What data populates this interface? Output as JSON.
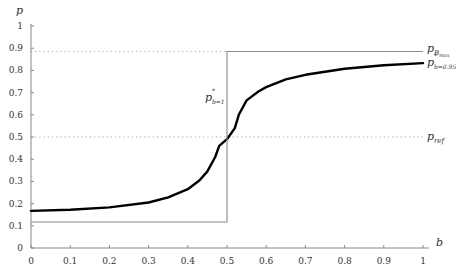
{
  "chart_data": {
    "type": "line",
    "title": "",
    "xlabel": "b",
    "ylabel": "p",
    "xlim": [
      0,
      1
    ],
    "ylim": [
      0,
      1
    ],
    "grid": false,
    "legend": "inline labels at right edge",
    "x_ticks": [
      "0",
      "0.1",
      "0.2",
      "0.3",
      "0.4",
      "0.5",
      "0.6",
      "0.7",
      "0.8",
      "0.9",
      "1"
    ],
    "y_ticks": [
      "0",
      "0.1",
      "0.2",
      "0.3",
      "0.4",
      "0.5",
      "0.6",
      "0.7",
      "0.8",
      "0.9",
      "1"
    ],
    "series": [
      {
        "name": "p*_{b=0.95}",
        "style": "thick solid black",
        "x": [
          0,
          0.1,
          0.2,
          0.3,
          0.35,
          0.4,
          0.43,
          0.45,
          0.47,
          0.48,
          0.5,
          0.52,
          0.53,
          0.55,
          0.58,
          0.6,
          0.65,
          0.7,
          0.8,
          0.9,
          1.0
        ],
        "y": [
          0.167,
          0.172,
          0.183,
          0.205,
          0.228,
          0.265,
          0.305,
          0.345,
          0.41,
          0.46,
          0.49,
          0.54,
          0.6,
          0.665,
          0.705,
          0.725,
          0.76,
          0.78,
          0.807,
          0.823,
          0.833
        ]
      },
      {
        "name": "p*_{b=1}",
        "style": "thin solid gray step",
        "x": [
          0,
          0.5,
          0.5,
          1.0
        ],
        "y": [
          0.117,
          0.117,
          0.885,
          0.885
        ]
      },
      {
        "name": "p_{B_max}",
        "style": "dotted gray horizontal",
        "x": [
          0,
          1
        ],
        "y": [
          0.885,
          0.885
        ]
      },
      {
        "name": "p_ref",
        "style": "dotted gray horizontal",
        "x": [
          0,
          1
        ],
        "y": [
          0.5,
          0.5
        ]
      }
    ],
    "annotations": [
      {
        "text": "p*_{b=1}",
        "x": 0.45,
        "y": 0.67
      },
      {
        "text": "p_{B_max}",
        "x": 1.02,
        "y": 0.885
      },
      {
        "text": "p*_{b=0.95}",
        "x": 1.02,
        "y": 0.84
      },
      {
        "text": "p_ref",
        "x": 1.02,
        "y": 0.5
      }
    ]
  },
  "labels": {
    "y_axis": "p",
    "x_axis": "b",
    "p_bmax_main": "p",
    "p_bmax_sub": "B",
    "p_bmax_subsub": "max",
    "p_b095_main": "p",
    "p_b095_sup": "*",
    "p_b095_sub": "b=0.95",
    "p_b1_main": "p",
    "p_b1_sup": "*",
    "p_b1_sub": "b=1",
    "p_ref_main": "p",
    "p_ref_sub": "ref"
  },
  "colors": {
    "axis": "#888888",
    "main_curve": "#000000",
    "step_line": "#8a8a8a",
    "dotted": "#aaaaaa"
  }
}
